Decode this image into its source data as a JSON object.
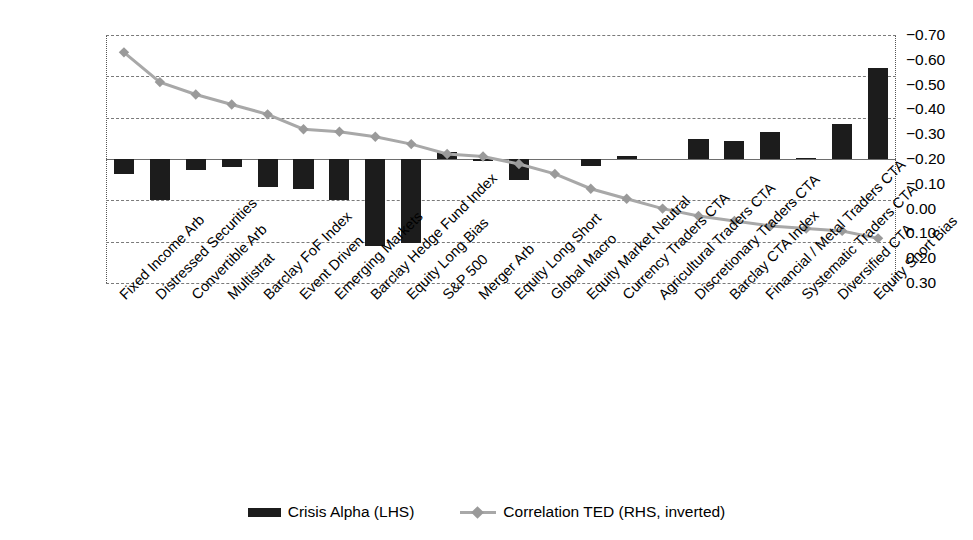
{
  "chart_data": {
    "type": "bar",
    "title": "",
    "subtitle": "",
    "xlabel": "",
    "ylabel": "",
    "grid": true,
    "legend_position": "bottom",
    "categories": [
      "Fixed Income Arb",
      "Distressed Securities",
      "Convertible Arb",
      "Multistrat",
      "Barclay FoF Index",
      "Event Driven",
      "Emerging Markets",
      "Barclay Hedge Fund Index",
      "Equity Long Bias",
      "S&P 500",
      "Merger Arb",
      "Equity Long Short",
      "Global Macro",
      "Equity Market Neutral",
      "Currency Traders CTA",
      "Agricultural Traders CTA",
      "Discretionary Traders CTA",
      "Barclay CTA Index",
      "Financial / Metal Traders CTA",
      "Systematic Traders CTA",
      "Diversified CTA",
      "Equity Short Bias"
    ],
    "series": [
      {
        "name": "Crisis Alpha (LHS)",
        "axis": "left",
        "kind": "bar",
        "color": "#1c1c1c",
        "unit": "%",
        "values": [
          -1.8,
          -5.0,
          -1.3,
          -1.0,
          -3.4,
          -3.6,
          -5.0,
          -10.5,
          -10.2,
          0.8,
          -0.3,
          -2.5,
          0.0,
          -0.9,
          0.4,
          0.0,
          2.4,
          2.2,
          3.3,
          0.1,
          4.2,
          11.0
        ]
      },
      {
        "name": "Correlation TED (RHS, inverted)",
        "axis": "right",
        "kind": "line",
        "color": "#a8a8a8",
        "marker": "diamond",
        "values": [
          -0.63,
          -0.51,
          -0.46,
          -0.42,
          -0.38,
          -0.32,
          -0.31,
          -0.29,
          -0.26,
          -0.22,
          -0.21,
          -0.18,
          -0.14,
          -0.08,
          -0.04,
          0.0,
          0.03,
          0.05,
          0.07,
          0.08,
          0.09,
          0.12
        ]
      }
    ],
    "axes": {
      "left": {
        "label": "",
        "ticks": [
          "15%",
          "10%",
          "5%",
          "0%",
          "−5%",
          "−10%",
          "−15%"
        ],
        "tick_values": [
          15,
          10,
          5,
          0,
          -5,
          -10,
          -15
        ],
        "ylim": [
          -15,
          15
        ]
      },
      "right": {
        "label": "",
        "inverted": true,
        "ticks": [
          "−0.70",
          "−0.60",
          "−0.50",
          "−0.40",
          "−0.30",
          "−0.20",
          "−0.10",
          "0.00",
          "0.10",
          "0.20",
          "0.30"
        ],
        "tick_values": [
          -0.7,
          -0.6,
          -0.5,
          -0.4,
          -0.3,
          -0.2,
          -0.1,
          0.0,
          0.1,
          0.2,
          0.3
        ],
        "ylim": [
          -0.7,
          0.3
        ]
      }
    },
    "legend": [
      {
        "label": "Crisis Alpha (LHS)",
        "marker": "bar-swatch",
        "color": "#1c1c1c"
      },
      {
        "label": "Correlation TED (RHS, inverted)",
        "marker": "line-diamond-swatch",
        "color": "#a8a8a8"
      }
    ]
  }
}
